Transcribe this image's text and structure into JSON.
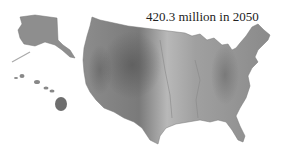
{
  "caption": "420.3 million in 2050",
  "map": {
    "subject": "United States shaded relief map",
    "regions": [
      "contiguous-us",
      "alaska",
      "hawaii"
    ],
    "colors": {
      "land_light": "#c8c8c8",
      "land_mid": "#9a9a9a",
      "land_dark": "#5e5e5e",
      "background": "#ffffff"
    }
  }
}
